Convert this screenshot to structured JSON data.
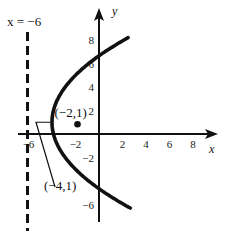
{
  "diagram": {
    "type": "parabola-graph",
    "equation_implied": "(y-1)^2 = 8(x+4)",
    "axes": {
      "x_label": "x",
      "y_label": "y",
      "x_ticks": [
        {
          "value": -6,
          "label": "-6"
        },
        {
          "value": -2,
          "label": "-2"
        },
        {
          "value": 2,
          "label": "2"
        },
        {
          "value": 4,
          "label": "4"
        },
        {
          "value": 6,
          "label": "6"
        },
        {
          "value": 8,
          "label": "8"
        }
      ],
      "y_ticks": [
        {
          "value": 8,
          "label": "8"
        },
        {
          "value": 6,
          "label": "6"
        },
        {
          "value": 4,
          "label": "4"
        },
        {
          "value": 2,
          "label": "2"
        },
        {
          "value": -2,
          "label": "-2"
        },
        {
          "value": -6,
          "label": "-6"
        }
      ]
    },
    "directrix": {
      "x": -6,
      "label": "x = −6"
    },
    "focus": {
      "x": -2,
      "y": 1,
      "label": "(−2,1)"
    },
    "vertex": {
      "x": -4,
      "y": 1,
      "label": "(−4,1)"
    },
    "parabola": {
      "vertex_x": -4,
      "vertex_y": 1,
      "p": 2,
      "y_range": [
        -6.3,
        8.2
      ]
    },
    "colors": {
      "ink": "#111111",
      "background": "#ffffff"
    }
  }
}
